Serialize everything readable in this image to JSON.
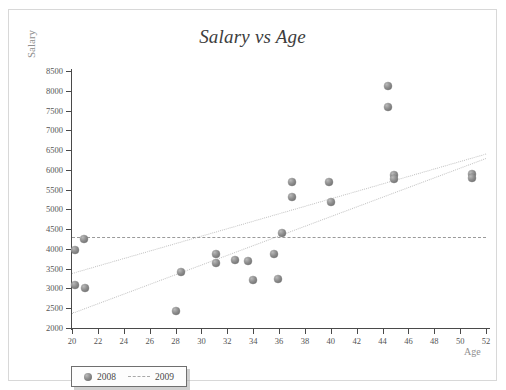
{
  "top_strip_ghost": "",
  "chart_data": {
    "type": "scatter",
    "title": "Salary vs Age",
    "xlabel": "Age",
    "ylabel": "Salary",
    "xlim": [
      20,
      52
    ],
    "ylim": [
      2000,
      8500
    ],
    "xticks": [
      20,
      22,
      24,
      26,
      28,
      30,
      32,
      34,
      36,
      38,
      40,
      42,
      44,
      46,
      48,
      50,
      52
    ],
    "yticks": [
      2000,
      2500,
      3000,
      3500,
      4000,
      4500,
      5000,
      5500,
      6000,
      6500,
      7000,
      7500,
      8000,
      8500
    ],
    "grid": false,
    "legend_position": "bottom-left",
    "legend": [
      {
        "label": "2008",
        "marker": "circle"
      },
      {
        "label": "2009",
        "marker": "dashed-line"
      }
    ],
    "series": [
      {
        "name": "2008",
        "marker_color": "#8d8d8d",
        "points": [
          {
            "x": 20.2,
            "y": 3980
          },
          {
            "x": 20.2,
            "y": 3080
          },
          {
            "x": 20.9,
            "y": 4250
          },
          {
            "x": 21.0,
            "y": 3000
          },
          {
            "x": 28.0,
            "y": 2430
          },
          {
            "x": 28.4,
            "y": 3420
          },
          {
            "x": 31.1,
            "y": 3860
          },
          {
            "x": 31.1,
            "y": 3650
          },
          {
            "x": 32.6,
            "y": 3720
          },
          {
            "x": 33.6,
            "y": 3690
          },
          {
            "x": 34.0,
            "y": 3220
          },
          {
            "x": 35.6,
            "y": 3880
          },
          {
            "x": 35.9,
            "y": 3230
          },
          {
            "x": 36.2,
            "y": 4400
          },
          {
            "x": 37.0,
            "y": 5700
          },
          {
            "x": 37.0,
            "y": 5310
          },
          {
            "x": 39.9,
            "y": 5700
          },
          {
            "x": 40.0,
            "y": 5180
          },
          {
            "x": 44.4,
            "y": 8120
          },
          {
            "x": 44.4,
            "y": 7600
          },
          {
            "x": 44.9,
            "y": 5860
          },
          {
            "x": 44.9,
            "y": 5760
          },
          {
            "x": 50.9,
            "y": 5900
          },
          {
            "x": 50.9,
            "y": 5790
          }
        ]
      }
    ],
    "trend_lines": [
      {
        "name": "trend-upper",
        "style": "dotted",
        "x1": 20,
        "y1": 3400,
        "x2": 52,
        "y2": 6420
      },
      {
        "name": "trend-lower",
        "style": "dotted",
        "x1": 20,
        "y1": 2380,
        "x2": 52,
        "y2": 6300
      },
      {
        "name": "reference-horizontal",
        "style": "dashed",
        "x1": 20,
        "y1": 4310,
        "x2": 52,
        "y2": 4310
      }
    ]
  }
}
